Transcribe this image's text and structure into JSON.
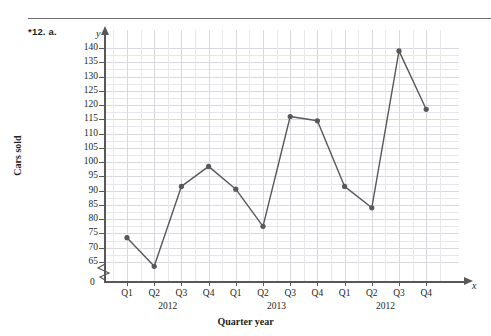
{
  "page": {
    "problem_label": "*12. a."
  },
  "chart_data": {
    "type": "line",
    "title": "",
    "xlabel": "Quarter year",
    "ylabel": "Cars sold",
    "x_axis_variable": "x",
    "y_axis_variable": "y",
    "categories": [
      "Q1",
      "Q2",
      "Q3",
      "Q4",
      "Q1",
      "Q2",
      "Q3",
      "Q4",
      "Q1",
      "Q2",
      "Q3",
      "Q4"
    ],
    "group_labels": [
      "2012",
      "2013",
      "2012"
    ],
    "values": [
      73.5,
      63.5,
      91.5,
      98.5,
      90.5,
      77.5,
      116,
      114.5,
      91.5,
      84,
      139,
      118.5
    ],
    "ylim": [
      65,
      140
    ],
    "y_ticks": [
      65,
      70,
      75,
      80,
      85,
      90,
      95,
      100,
      105,
      110,
      115,
      120,
      125,
      130,
      135,
      140
    ],
    "y_tick_labels": [
      "65",
      "70",
      "75",
      "80",
      "85",
      "90",
      "95",
      "100",
      "105",
      "110",
      "115",
      "120",
      "125",
      "130",
      "135",
      "140"
    ],
    "origin_label": "0",
    "axis_break": true,
    "grid": true,
    "legend": "none",
    "marker": "filled-circle",
    "series_color": "#58585b",
    "grid_color": "#d9d9dd",
    "axis_color": "#58585b"
  }
}
